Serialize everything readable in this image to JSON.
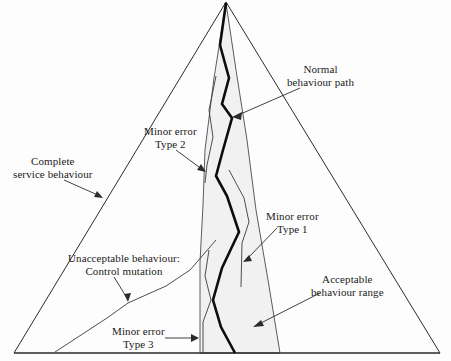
{
  "figure": {
    "type": "diagram",
    "title": "",
    "background_color": "#fdfdfd",
    "band_fill_color": "#f1f1f1",
    "line_color": "#2b2b2b",
    "path_color": "#0d0d0d"
  },
  "labels": {
    "normal_behaviour_path": {
      "line1": "Normal",
      "line2": "behaviour path"
    },
    "minor_error_type_2": {
      "line1": "Minor error",
      "line2": "Type 2"
    },
    "complete_service_behaviour": {
      "line1": "Complete",
      "line2": "service behaviour"
    },
    "minor_error_type_1": {
      "line1": "Minor error",
      "line2": "Type 1"
    },
    "unacceptable_behaviour": {
      "line1": "Unacceptable behaviour:",
      "line2": "Control mutation"
    },
    "acceptable_behaviour_range": {
      "line1": "Acceptable",
      "line2": "behaviour range"
    },
    "minor_error_type_3": {
      "line1": "Minor error",
      "line2": "Type 3"
    }
  },
  "geometry": {
    "triangle": {
      "apex": [
        226,
        2
      ],
      "base_left": [
        14,
        353
      ],
      "base_right": [
        440,
        353
      ]
    },
    "acceptable_band": {
      "left_edge": [
        [
          226,
          3
        ],
        [
          214,
          78
        ],
        [
          205,
          150
        ],
        [
          203,
          205
        ],
        [
          200,
          262
        ],
        [
          200,
          353
        ]
      ],
      "right_edge": [
        [
          226,
          3
        ],
        [
          236,
          70
        ],
        [
          247,
          140
        ],
        [
          256,
          210
        ],
        [
          268,
          280
        ],
        [
          280,
          353
        ]
      ]
    },
    "normal_behaviour_path": [
      [
        226,
        3
      ],
      [
        220,
        45
      ],
      [
        229,
        78
      ],
      [
        222,
        104
      ],
      [
        232,
        118
      ],
      [
        223,
        150
      ],
      [
        216,
        176
      ],
      [
        227,
        196
      ],
      [
        239,
        232
      ],
      [
        222,
        268
      ],
      [
        213,
        300
      ],
      [
        221,
        327
      ],
      [
        235,
        353
      ]
    ],
    "minor_error_type_2_path": [
      [
        216,
        76
      ],
      [
        209,
        110
      ],
      [
        213,
        137
      ],
      [
        207,
        165
      ],
      [
        205,
        183
      ]
    ],
    "minor_error_type_1_path": [
      [
        229,
        170
      ],
      [
        244,
        198
      ],
      [
        249,
        222
      ],
      [
        242,
        243
      ],
      [
        241,
        287
      ]
    ],
    "unacceptable_behaviour_path": [
      [
        55,
        352
      ],
      [
        78,
        337
      ],
      [
        107,
        318
      ],
      [
        128,
        303
      ],
      [
        166,
        286
      ],
      [
        190,
        270
      ],
      [
        216,
        240
      ]
    ],
    "minor_error_type_3_extra": [
      [
        203,
        322
      ],
      [
        211,
        300
      ],
      [
        205,
        276
      ]
    ]
  },
  "annotations": {
    "normal_behaviour_path_arrow": {
      "from": [
        300,
        88
      ],
      "to": [
        232,
        117
      ]
    },
    "minor_error_type_2_arrow": {
      "from": [
        176,
        150
      ],
      "to": [
        206,
        172
      ]
    },
    "complete_service_behaviour_arrow": {
      "from": [
        64,
        180
      ],
      "to": [
        103,
        198
      ]
    },
    "minor_error_type_1_arrow": {
      "from": [
        277,
        228
      ],
      "to": [
        243,
        262
      ]
    },
    "unacceptable_behaviour_arrow": {
      "from": [
        114,
        277
      ],
      "to": [
        128,
        302
      ]
    },
    "acceptable_behaviour_range_arrow": {
      "from": [
        320,
        293
      ],
      "to": [
        253,
        327
      ]
    },
    "minor_error_type_3_arrow": {
      "from": [
        165,
        338
      ],
      "to": [
        199,
        338
      ]
    }
  }
}
